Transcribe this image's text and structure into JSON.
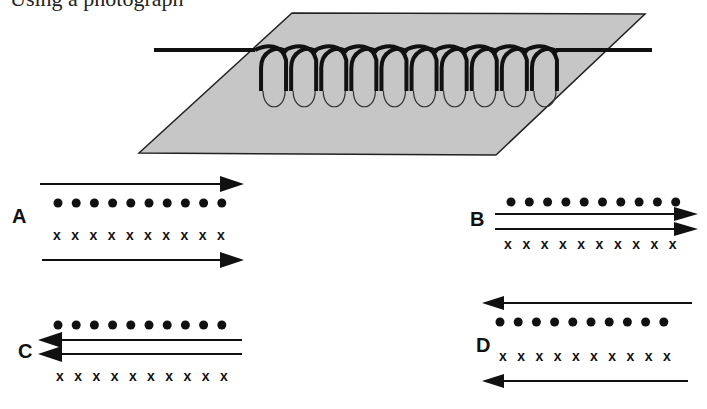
{
  "header": {
    "clipped_text": "Using a photograph"
  },
  "figure": {
    "plane_color": "#c8c8c8",
    "coil_turns": 10
  },
  "options": [
    {
      "label": "A",
      "current_directions": [
        "right",
        "right"
      ],
      "dots_count": 10,
      "crosses_count": 10,
      "layout": "dots-top-crosses-bottom, arrows outside"
    },
    {
      "label": "B",
      "current_directions": [
        "right",
        "right"
      ],
      "dots_count": 10,
      "crosses_count": 10,
      "layout": "arrows between dots and crosses"
    },
    {
      "label": "C",
      "current_directions": [
        "left",
        "left"
      ],
      "dots_count": 10,
      "crosses_count": 10,
      "layout": "arrows between dots and crosses"
    },
    {
      "label": "D",
      "current_directions": [
        "left",
        "left"
      ],
      "dots_count": 10,
      "crosses_count": 10,
      "layout": "dots-top-crosses-bottom, arrows outside"
    }
  ],
  "symbols": {
    "dot": "•",
    "cross": "x"
  }
}
